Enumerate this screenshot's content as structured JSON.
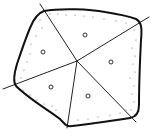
{
  "diagram": {
    "type": "partitioned-region",
    "colors": {
      "background": "#ffffff",
      "outline": "#111111",
      "spoke": "#222222",
      "node": "#333333",
      "dot": "#666666"
    },
    "outline_path": "M44 11 C 60 8, 90 9, 105 12 C 118 14, 128 16, 136 19 C 142 22, 142 30, 141 40 C 140 60, 139 85, 139 105 C 139 113, 136 117, 130 118 C 110 121, 90 124, 72 126 C 66 127, 64 123, 60 119 C 45 108, 28 98, 16 86 C 13 82, 14 74, 17 64 C 21 52, 25 40, 30 28 C 34 18, 38 13, 44 11 Z",
    "center": {
      "x": 77,
      "y": 61
    },
    "spokes": [
      {
        "id": "spoke-top-left",
        "x2": 40,
        "y2": 4
      },
      {
        "id": "spoke-top-right",
        "x2": 149,
        "y2": 17
      },
      {
        "id": "spoke-left",
        "x2": 3,
        "y2": 89
      },
      {
        "id": "spoke-bottom",
        "x2": 67,
        "y2": 128
      },
      {
        "id": "spoke-bottom-right",
        "x2": 136,
        "y2": 122
      }
    ],
    "nodes": [
      {
        "id": "sector-top",
        "cx": 85,
        "cy": 35,
        "r": 2
      },
      {
        "id": "sector-left",
        "cx": 43,
        "cy": 52,
        "r": 2
      },
      {
        "id": "sector-right",
        "cx": 111,
        "cy": 62,
        "r": 2
      },
      {
        "id": "sector-bottom-left",
        "cx": 51,
        "cy": 87,
        "r": 2
      },
      {
        "id": "sector-bottom-right",
        "cx": 88,
        "cy": 96,
        "r": 2
      }
    ],
    "dots": [
      [
        50,
        14
      ],
      [
        58,
        14
      ],
      [
        66,
        15
      ],
      [
        75,
        15
      ],
      [
        84,
        16
      ],
      [
        93,
        17
      ],
      [
        104,
        19
      ],
      [
        116,
        21
      ],
      [
        126,
        23
      ],
      [
        40,
        20
      ],
      [
        42,
        28
      ],
      [
        36,
        36
      ],
      [
        31,
        44
      ],
      [
        30,
        54
      ],
      [
        27,
        62
      ],
      [
        24,
        70
      ],
      [
        21,
        78
      ],
      [
        134,
        30
      ],
      [
        136,
        40
      ],
      [
        132,
        48
      ],
      [
        135,
        56
      ],
      [
        133,
        64
      ],
      [
        135,
        72
      ],
      [
        130,
        78
      ],
      [
        134,
        86
      ],
      [
        132,
        94
      ],
      [
        134,
        102
      ],
      [
        131,
        110
      ],
      [
        23,
        90
      ],
      [
        30,
        95
      ],
      [
        37,
        100
      ],
      [
        44,
        104
      ],
      [
        52,
        106
      ],
      [
        56,
        110
      ],
      [
        78,
        120
      ],
      [
        88,
        119
      ],
      [
        98,
        117
      ],
      [
        110,
        115
      ],
      [
        120,
        113
      ],
      [
        126,
        110
      ],
      [
        68,
        122
      ]
    ]
  }
}
